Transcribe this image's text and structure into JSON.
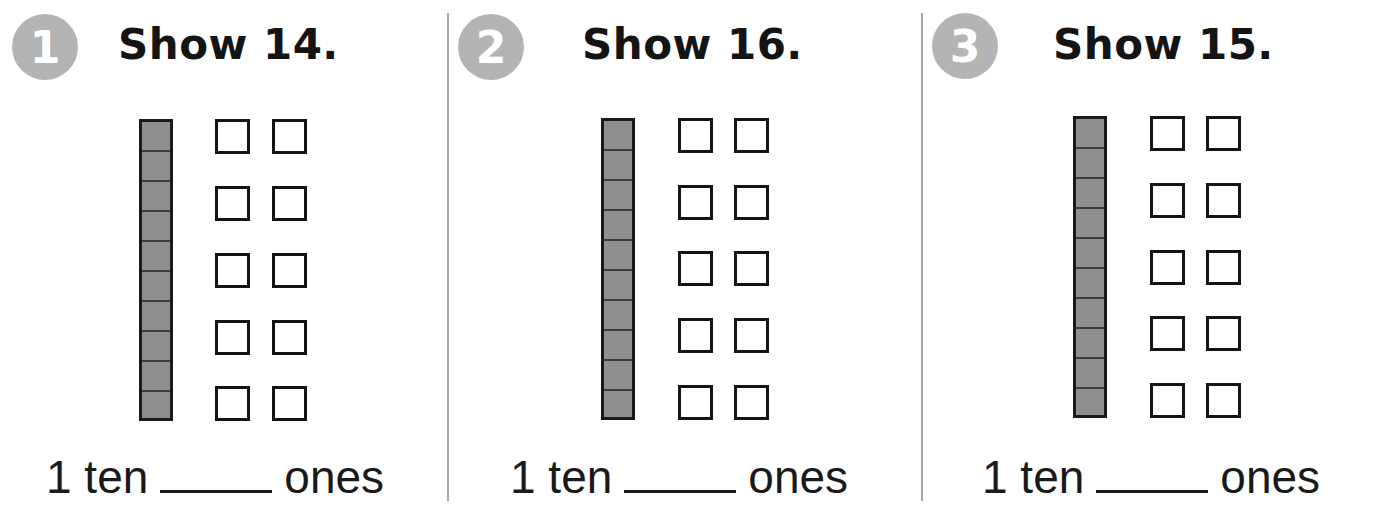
{
  "problems": [
    {
      "number": "1",
      "title": "Show 14.",
      "target": 14,
      "tens_rods": 1,
      "ones_boxes": 10,
      "sentence": {
        "prefix": "1 ten",
        "blank": "",
        "suffix": "ones"
      }
    },
    {
      "number": "2",
      "title": "Show 16.",
      "target": 16,
      "tens_rods": 1,
      "ones_boxes": 10,
      "sentence": {
        "prefix": "1 ten",
        "blank": "",
        "suffix": "ones"
      }
    },
    {
      "number": "3",
      "title": "Show 15.",
      "target": 15,
      "tens_rods": 1,
      "ones_boxes": 10,
      "sentence": {
        "prefix": "1 ten",
        "blank": "",
        "suffix": "ones"
      }
    }
  ],
  "colors": {
    "badge": "#b4b4b4",
    "rod_fill": "#8f8f8f",
    "divider": "#a6a6a6"
  }
}
